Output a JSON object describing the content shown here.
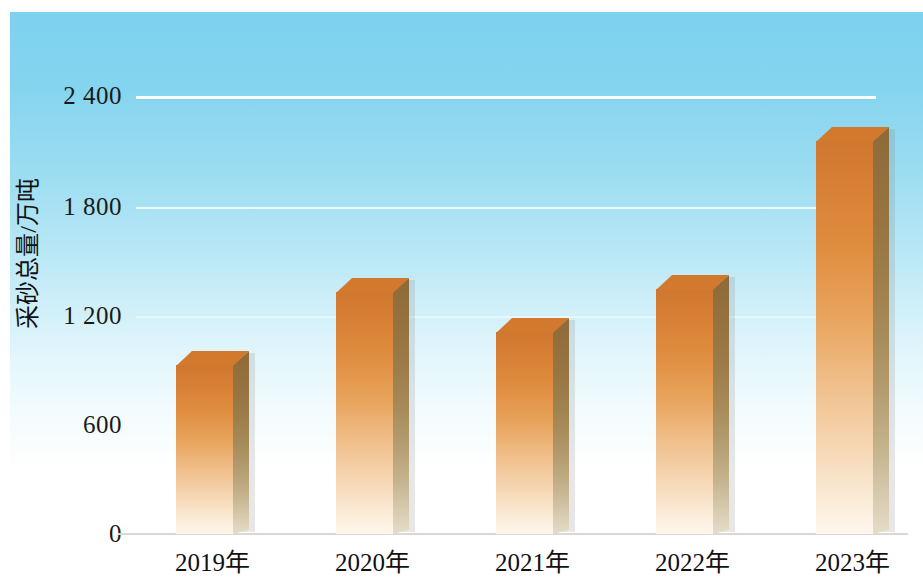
{
  "chart_data": {
    "type": "bar",
    "title": "",
    "subtitle": "",
    "xlabel": "",
    "ylabel": "采砂总量/万吨",
    "categories": [
      "2019年",
      "2020年",
      "2021年",
      "2022年",
      "2023年"
    ],
    "values": [
      1000,
      1405,
      1185,
      1420,
      2230
    ],
    "series": [
      {
        "name": "采砂总量",
        "values": [
          1000,
          1405,
          1185,
          1420,
          2230
        ]
      }
    ],
    "ylim": [
      0,
      2500
    ],
    "y_ticks": [
      0,
      600,
      1200,
      1800,
      2400
    ],
    "y_tick_labels": [
      "0",
      "600",
      "1 200",
      "1 800",
      "2 400"
    ],
    "grid": true,
    "grid_axis": "y",
    "legend": false,
    "legend_position": "none",
    "bar_style": "3d-column",
    "colors": {
      "bar_top": "#d2792e",
      "bar_front_top": "#cf7730",
      "bar_front_bottom": "#fdf6ec",
      "bar_side_top": "#8d6a3a",
      "bar_side_bottom": "#e6ddc8",
      "background_top": "#7ed2ef",
      "background_bottom": "#ffffff",
      "gridline": "#ffffff",
      "text": "#111111"
    }
  },
  "axes": {
    "y_title": "采砂总量/万吨",
    "y_ticks": [
      {
        "label": "2 400",
        "value": 2400
      },
      {
        "label": "1 800",
        "value": 1800
      },
      {
        "label": "1 200",
        "value": 1200
      },
      {
        "label": "600",
        "value": 600
      },
      {
        "label": "0",
        "value": 0
      }
    ],
    "x_ticks": [
      {
        "label": "2019年"
      },
      {
        "label": "2020年"
      },
      {
        "label": "2021年"
      },
      {
        "label": "2022年"
      },
      {
        "label": "2023年"
      }
    ]
  }
}
